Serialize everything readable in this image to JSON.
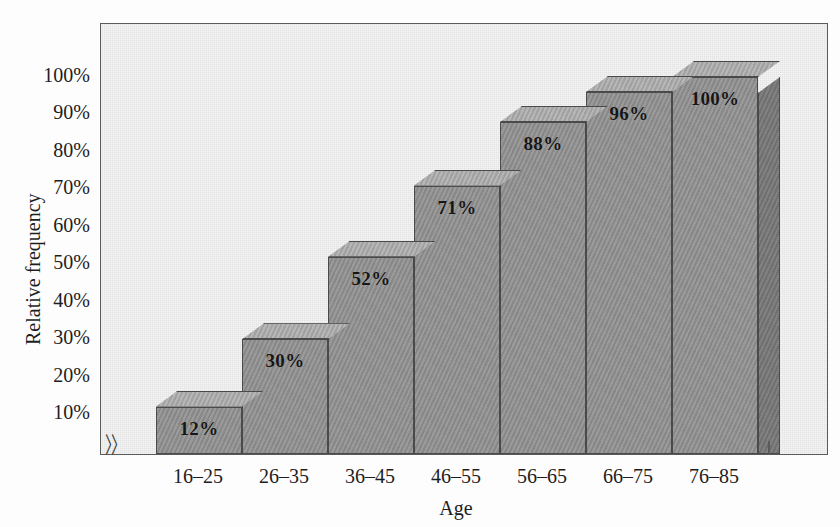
{
  "chart_data": {
    "type": "bar",
    "title": "",
    "subtitle": "",
    "xlabel": "Age",
    "ylabel": "Relative frequency",
    "categories": [
      "16–25",
      "26–35",
      "36–45",
      "46–55",
      "56–65",
      "66–75",
      "76–85"
    ],
    "values": [
      12,
      30,
      52,
      71,
      88,
      96,
      100
    ],
    "data_labels": [
      "12%",
      "30%",
      "52%",
      "71%",
      "88%",
      "96%",
      "100%"
    ],
    "ylim": [
      0,
      110
    ],
    "ytick_values": [
      10,
      20,
      30,
      40,
      50,
      60,
      70,
      80,
      90,
      100
    ],
    "ytick_labels": [
      "10%",
      "20%",
      "30%",
      "40%",
      "50%",
      "60%",
      "70%",
      "80%",
      "90%",
      "100%"
    ],
    "grid": false,
    "legend": null,
    "style": "3d-shaded-bars",
    "axis_break": "⟨⟨"
  },
  "colors": {
    "plot_background": "#eaeaea",
    "page_background": "#fdfdfd",
    "bar_front": "#8f8f8f",
    "bar_top": "#a8a8a8",
    "bar_side": "#777777",
    "bar_outline": "#4a4a4a",
    "axis": "#5a5a5a",
    "text": "#1d1d1d",
    "label_text": "#161616"
  }
}
